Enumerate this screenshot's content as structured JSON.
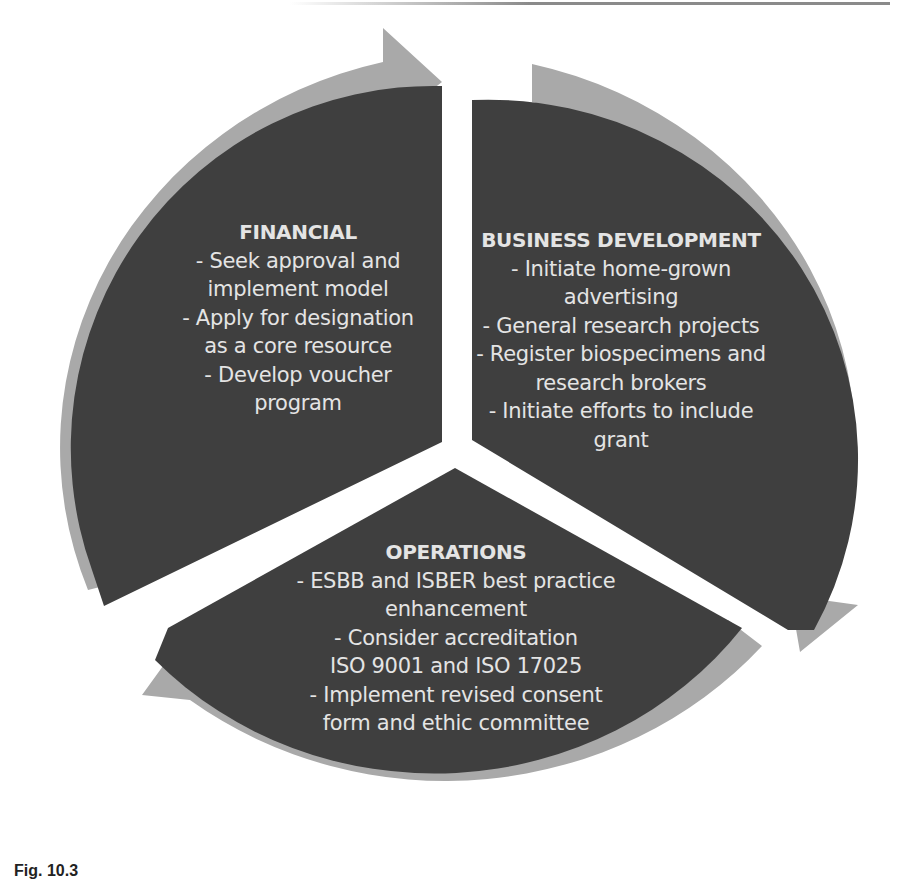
{
  "diagram": {
    "type": "cycle",
    "colors": {
      "segment": "#3f3f3f",
      "arrow": "#a9a9a9",
      "text": "#e4e4e4",
      "background": "#ffffff"
    },
    "segments": [
      {
        "id": "financial",
        "title": "FINANCIAL",
        "lines": [
          "- Seek approval and",
          "implement model",
          "- Apply for designation",
          "as a core resource",
          "- Develop voucher",
          "program"
        ]
      },
      {
        "id": "business-development",
        "title": "BUSINESS DEVELOPMENT",
        "lines": [
          "- Initiate home-grown",
          "advertising",
          "- General research projects",
          "- Register biospecimens and",
          "research brokers",
          "- Initiate efforts to include",
          "grant"
        ]
      },
      {
        "id": "operations",
        "title": "OPERATIONS",
        "lines": [
          "- ESBB and ISBER best practice",
          "enhancement",
          "- Consider accreditation",
          "ISO 9001 and ISO 17025",
          "- Implement revised consent",
          "form and ethic committee"
        ]
      }
    ],
    "flow": [
      "financial",
      "business-development",
      "operations",
      "financial"
    ]
  },
  "caption": {
    "text": "Fig. 10.3"
  }
}
